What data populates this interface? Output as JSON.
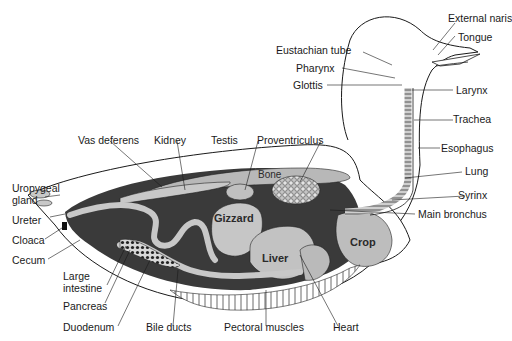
{
  "figure": {
    "colors": {
      "background": "#ffffff",
      "cavity": "#3a3a3a",
      "organ": "#bdbdbd",
      "organ_light": "#d2d2d2",
      "outline": "#1a1a1a"
    }
  },
  "labels": {
    "external_naris": "External naris",
    "tongue": "Tongue",
    "eustachian_tube": "Eustachian tube",
    "pharynx": "Pharynx",
    "glottis": "Glottis",
    "larynx": "Larynx",
    "trachea": "Trachea",
    "esophagus": "Esophagus",
    "lung": "Lung",
    "syrinx": "Syrinx",
    "main_bronchus": "Main bronchus",
    "vas_deferens": "Vas deferens",
    "kidney": "Kidney",
    "testis": "Testis",
    "proventriculus": "Proventriculus",
    "bone": "Bone",
    "uropygeal_gland_1": "Uropygeal",
    "uropygeal_gland_2": "gland",
    "ureter": "Ureter",
    "cloaca": "Cloaca",
    "cecum": "Cecum",
    "large_intestine_1": "Large",
    "large_intestine_2": "intestine",
    "pancreas": "Pancreas",
    "duodenum": "Duodenum",
    "bile_ducts": "Bile ducts",
    "pectoral_muscles": "Pectoral muscles",
    "heart": "Heart",
    "gizzard": "Gizzard",
    "liver": "Liver",
    "crop": "Crop"
  }
}
